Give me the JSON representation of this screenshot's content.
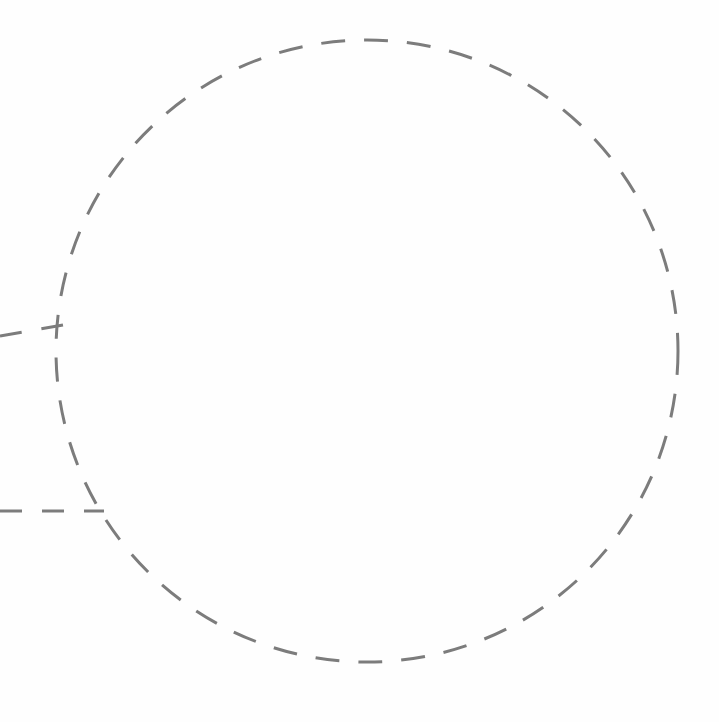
{
  "canvas": {
    "width": 719,
    "height": 722,
    "background_color": "#fefefe",
    "title": "Dashed circle with two radial connector lines"
  },
  "style": {
    "stroke_color": "#7c7c7c",
    "stroke_width": 3,
    "dash_length": 24,
    "gap_length": 19,
    "line_dash_length": 22,
    "line_gap_length": 20
  },
  "shapes": {
    "circle": {
      "name": "dashed-circle",
      "center_x": 367,
      "center_y": 351,
      "radius": 311,
      "left_extent": 56,
      "right_extent": 678,
      "top_extent": 40,
      "bottom_extent": 662,
      "stroke_color": "#7c7c7c",
      "stroke_width": 3,
      "dash_pattern": "24 19",
      "fill": "none"
    },
    "connectors": [
      {
        "name": "upper-connector-line",
        "x1": 0,
        "y1": 336,
        "x2": 63,
        "y2": 325,
        "stroke_color": "#7c7c7c",
        "stroke_width": 3,
        "dash_pattern": "22 20"
      },
      {
        "name": "lower-connector-line",
        "x1": 0,
        "y1": 511,
        "x2": 104,
        "y2": 511,
        "stroke_color": "#7c7c7c",
        "stroke_width": 3,
        "dash_pattern": "22 20"
      }
    ]
  },
  "chart_data": {
    "type": "diagram",
    "elements": [
      {
        "kind": "circle",
        "label": "dashed-circle",
        "cx": 367,
        "cy": 351,
        "r": 311,
        "line_style": "dashed",
        "color": "#7c7c7c"
      },
      {
        "kind": "line",
        "label": "upper-connector-line",
        "from": [
          0,
          336
        ],
        "to": [
          63,
          325
        ],
        "line_style": "dashed",
        "color": "#7c7c7c"
      },
      {
        "kind": "line",
        "label": "lower-connector-line",
        "from": [
          0,
          511
        ],
        "to": [
          104,
          511
        ],
        "line_style": "dashed",
        "color": "#7c7c7c"
      }
    ],
    "xlim": [
      0,
      719
    ],
    "ylim": [
      0,
      722
    ],
    "grid": false,
    "legend": false
  }
}
